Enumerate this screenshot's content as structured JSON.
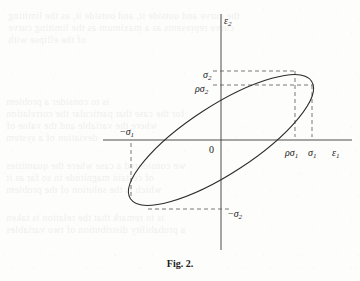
{
  "figure": {
    "caption": "Fig. 2.",
    "caption_position": {
      "x": 224,
      "y": 258
    },
    "origin_label": "0",
    "axes": {
      "x": {
        "label_base": "ε",
        "label_sub": "1",
        "label_x": 332,
        "label_y": 142,
        "line": {
          "x1": 103,
          "y1": 140,
          "x2": 352,
          "y2": 140
        }
      },
      "y": {
        "label_base": "ε",
        "label_sub": "2",
        "label_x": 224,
        "label_y": 10,
        "line": {
          "x1": 221,
          "y1": 14,
          "x2": 221,
          "y2": 250
        }
      }
    },
    "tick_labels": [
      {
        "name": "sigma-2-positive",
        "prefix": "",
        "base": "σ",
        "sub": "2",
        "x": 203,
        "y": 64,
        "value": "σ₂"
      },
      {
        "name": "rho-sigma-2",
        "prefix": "ρ",
        "base": "σ",
        "sub": "2",
        "x": 195,
        "y": 78,
        "value": "ρσ₂"
      },
      {
        "name": "sigma-1-negative",
        "prefix": "−",
        "base": "σ",
        "sub": "1",
        "x": 120,
        "y": 121,
        "value": "−σ₁"
      },
      {
        "name": "rho-sigma-1",
        "prefix": "ρ",
        "base": "σ",
        "sub": "1",
        "x": 285,
        "y": 142,
        "value": "ρσ₁"
      },
      {
        "name": "sigma-1-positive",
        "prefix": "",
        "base": "σ",
        "sub": "1",
        "x": 308,
        "y": 142,
        "value": "σ₁"
      },
      {
        "name": "sigma-2-negative",
        "prefix": "−",
        "base": "σ",
        "sub": "2",
        "x": 228,
        "y": 203,
        "value": "−σ₂"
      }
    ],
    "origin_x": 209,
    "origin_y": 139
  },
  "chart_data": {
    "type": "line",
    "title": "Fig. 2.",
    "xlabel": "ε₁",
    "ylabel": "ε₂",
    "grid": false,
    "legend": null,
    "center": {
      "x": 221,
      "y": 140
    },
    "semi_major_px": 108,
    "semi_minor_px": 34,
    "rotation_deg": -33,
    "xlim": [
      -1.15,
      1.6
    ],
    "ylim": [
      -1.4,
      1.8
    ],
    "axis_ticks": {
      "x": [
        "−σ₁",
        "0",
        "ρσ₁",
        "σ₁"
      ],
      "y": [
        "−σ₂",
        "ρσ₂",
        "σ₂"
      ]
    },
    "tangency_points_px": [
      {
        "name": "top-tangent-sigma2",
        "x": 295,
        "y": 71
      },
      {
        "name": "right-tangent-sigma1",
        "x": 312,
        "y": 85
      },
      {
        "name": "bottom-tangent-neg-sigma2",
        "x": 148,
        "y": 209
      },
      {
        "name": "left-tangent-neg-sigma1",
        "x": 131,
        "y": 195
      }
    ],
    "dashed_guides": [
      {
        "name": "sigma2-horizontal",
        "x1": 213,
        "y1": 71,
        "x2": 297,
        "y2": 71
      },
      {
        "name": "rho-sigma2-horizontal",
        "x1": 213,
        "y1": 85,
        "x2": 314,
        "y2": 85
      },
      {
        "name": "sigma1-vertical",
        "x1": 312,
        "y1": 85,
        "x2": 312,
        "y2": 137
      },
      {
        "name": "rho-sigma1-vertical",
        "x1": 295,
        "y1": 71,
        "x2": 295,
        "y2": 137
      },
      {
        "name": "neg-sigma1-vertical",
        "x1": 131,
        "y1": 143,
        "x2": 131,
        "y2": 196
      },
      {
        "name": "neg-sigma2-horizontal",
        "x1": 148,
        "y1": 209,
        "x2": 232,
        "y2": 209
      }
    ]
  },
  "ghost_text": [
    {
      "text": "the curve and outside it, and outside it, as the limiting",
      "x": 8,
      "y": 10
    },
    {
      "text": "curve represents as a maximum as the limiting curve",
      "x": 8,
      "y": 22
    },
    {
      "text": "of the ellipse with",
      "x": 8,
      "y": 34
    },
    {
      "text": "is to consider a problem",
      "x": 6,
      "y": 96
    },
    {
      "text": "for the case that particular the correlation",
      "x": 6,
      "y": 108
    },
    {
      "text": "where the variable and the value of",
      "x": 6,
      "y": 120
    },
    {
      "text": "deviation of a system",
      "x": 6,
      "y": 132
    },
    {
      "text": "we considered a case where the quantities",
      "x": 6,
      "y": 160
    },
    {
      "text": "of certain magnitude in so far as it",
      "x": 6,
      "y": 172
    },
    {
      "text": "which is the solution of the problem",
      "x": 6,
      "y": 184
    },
    {
      "text": "is to remark that the relation is taken",
      "x": 6,
      "y": 212
    },
    {
      "text": "a probability distribution of two variables",
      "x": 6,
      "y": 224
    }
  ]
}
